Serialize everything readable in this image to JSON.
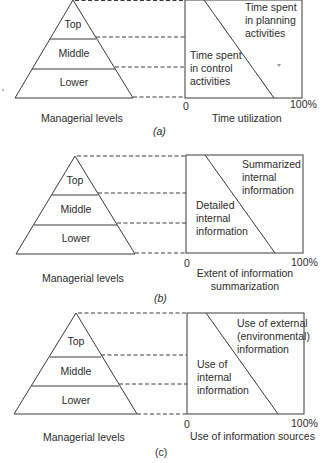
{
  "figure": {
    "panels": [
      {
        "id": "a",
        "caption": "(a)",
        "pyramid": {
          "title": "Managerial levels",
          "levels": [
            "Top",
            "Middle",
            "Lower"
          ]
        },
        "box": {
          "axis_min": "0",
          "axis_max": "100%",
          "xlabel": "Time utilization",
          "left_region": "Time spent\nin control\nactivities",
          "right_region": "Time spent\nin planning\nactivities"
        }
      },
      {
        "id": "b",
        "caption": "(b)",
        "pyramid": {
          "title": "Managerial levels",
          "levels": [
            "Top",
            "Middle",
            "Lower"
          ]
        },
        "box": {
          "axis_min": "0",
          "axis_max": "100%",
          "xlabel": "Extent of information\nsummarization",
          "left_region": "Detailed\ninternal\ninformation",
          "right_region": "Summarized\ninternal\ninformation"
        }
      },
      {
        "id": "c",
        "caption": "(c)",
        "pyramid": {
          "title": "Managerial levels",
          "levels": [
            "Top",
            "Middle",
            "Lower"
          ]
        },
        "box": {
          "axis_min": "0",
          "axis_max": "100%",
          "xlabel": "Use of information sources",
          "left_region": "Use of\ninternal\ninformation",
          "right_region": "Use of external\n(environmental)\ninformation"
        }
      }
    ],
    "line_color": "#3a3a3a"
  }
}
